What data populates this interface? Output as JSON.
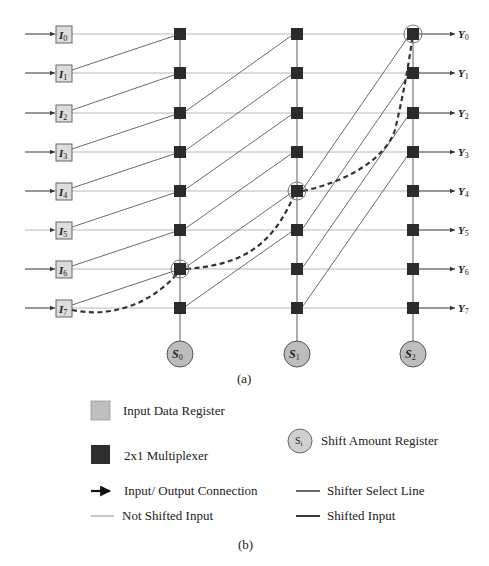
{
  "figure": {
    "inputs": [
      {
        "label": "I",
        "sub": "0"
      },
      {
        "label": "I",
        "sub": "1"
      },
      {
        "label": "I",
        "sub": "2"
      },
      {
        "label": "I",
        "sub": "3"
      },
      {
        "label": "I",
        "sub": "4"
      },
      {
        "label": "I",
        "sub": "5"
      },
      {
        "label": "I",
        "sub": "6"
      },
      {
        "label": "I",
        "sub": "7"
      }
    ],
    "outputs": [
      {
        "label": "Y",
        "sub": "0"
      },
      {
        "label": "Y",
        "sub": "1"
      },
      {
        "label": "Y",
        "sub": "2"
      },
      {
        "label": "Y",
        "sub": "3"
      },
      {
        "label": "Y",
        "sub": "4"
      },
      {
        "label": "Y",
        "sub": "5"
      },
      {
        "label": "Y",
        "sub": "6"
      },
      {
        "label": "Y",
        "sub": "7"
      }
    ],
    "select_registers": [
      {
        "label": "S",
        "sub": "0"
      },
      {
        "label": "S",
        "sub": "1"
      },
      {
        "label": "S",
        "sub": "2"
      }
    ],
    "stages": [
      {
        "select": "S0",
        "shift_by": 1
      },
      {
        "select": "S1",
        "shift_by": 2
      },
      {
        "select": "S2",
        "shift_by": 4
      }
    ],
    "highlighted_path": [
      "I7",
      "stage0-row6",
      "stage1-row4",
      "stage2-row0",
      "Y0"
    ],
    "subfigure_a_label": "(a)",
    "subfigure_b_label": "(b)"
  },
  "legend": {
    "input_data_register": "Input Data Register",
    "multiplexer": "2x1 Multiplexer",
    "shift_amount_register": "Shift Amount Register",
    "shift_amount_symbol": "S",
    "shift_amount_symbol_sub": "i",
    "io_connection": "Input/ Output Connection",
    "shifter_select_line": "Shifter Select Line",
    "not_shifted_input": "Not Shifted Input",
    "shifted_input": "Shifted Input"
  },
  "colors": {
    "input_register_fill": "#d9d9d9",
    "mux_fill": "#2b2b2b",
    "select_circle_fill": "#bdbdbd",
    "not_shifted_line": "#b5b5b5",
    "shifted_line": "#555555",
    "select_line": "#8a8a8a",
    "arrow": "#333333"
  }
}
